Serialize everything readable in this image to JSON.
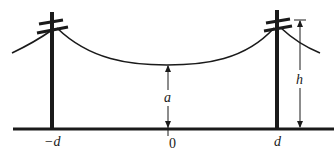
{
  "diagram": {
    "labels": {
      "left_pole": "−d",
      "origin": "0",
      "right_pole": "d",
      "sag_height": "a",
      "pole_height": "h"
    },
    "colors": {
      "stroke": "#1a1a1a",
      "background": "#ffffff"
    }
  }
}
